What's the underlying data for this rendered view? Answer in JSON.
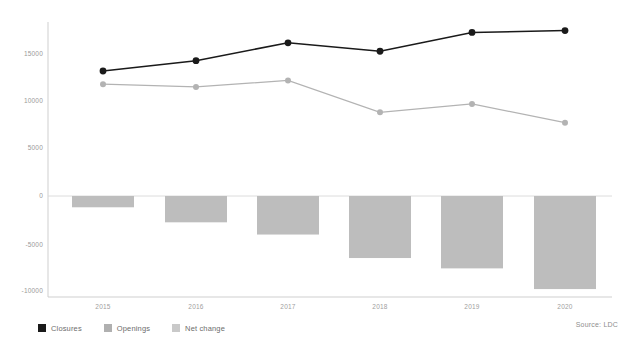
{
  "chart_data": {
    "type": "bar",
    "title": "",
    "subtitle": "",
    "xlabel": "",
    "ylabel": "",
    "categories": [
      "2015",
      "2016",
      "2017",
      "2018",
      "2019",
      "2020"
    ],
    "ylim": [
      -10000,
      17500
    ],
    "yticks": [
      15000,
      10000,
      5000,
      0,
      -5000,
      -10000
    ],
    "ytick_labels": [
      "15000",
      "10000",
      "5000",
      "0",
      "-5000",
      "-10000"
    ],
    "grid": false,
    "legend_position": "bottom-left",
    "series": [
      {
        "name": "Closures",
        "type": "line",
        "color": "#1a1a1a",
        "marker": "circle",
        "values": [
          13300,
          14400,
          16300,
          15400,
          17400,
          17600
        ]
      },
      {
        "name": "Openings",
        "type": "line",
        "color": "#b3b3b3",
        "marker": "circle",
        "values": [
          11900,
          11600,
          12300,
          8900,
          9800,
          7800
        ]
      },
      {
        "name": "Net change",
        "type": "bar",
        "color": "#bdbdbd",
        "values": [
          -1200,
          -2800,
          -4100,
          -6600,
          -7700,
          -9900
        ]
      }
    ],
    "annotations": [
      {
        "name": "source",
        "text": "Source: LDC"
      }
    ]
  },
  "legend": {
    "items": [
      {
        "label": "Closures",
        "color": "#1a1a1a",
        "name": "closures"
      },
      {
        "label": "Openings",
        "color": "#b0b0b0",
        "name": "openings"
      },
      {
        "label": "Net change",
        "color": "#c9c9c9",
        "name": "net-change"
      }
    ]
  },
  "source": {
    "text": "Source: LDC"
  },
  "axis": {
    "y_labels": [
      "15000",
      "10000",
      "5000",
      "0",
      "-5000",
      "-10000"
    ],
    "x_labels": [
      "2015",
      "2016",
      "2017",
      "2018",
      "2019",
      "2020"
    ]
  }
}
